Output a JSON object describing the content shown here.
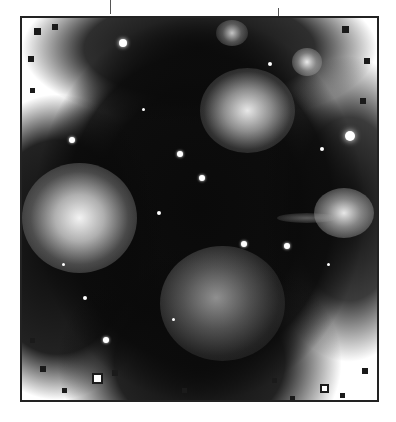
{
  "image": {
    "subject": "star cluster with reflection nebulae",
    "style": "grayscale",
    "frame_color": "#222222",
    "background_color": "#ffffff",
    "nebulae": [
      {
        "name": "left-nebula",
        "cx": 60,
        "cy": 200,
        "rx": 55,
        "ry": 50,
        "brightness": 0.95
      },
      {
        "name": "upper-center-nebula",
        "cx": 225,
        "cy": 90,
        "rx": 45,
        "ry": 38,
        "brightness": 0.85
      },
      {
        "name": "lower-center-nebula",
        "cx": 200,
        "cy": 285,
        "rx": 60,
        "ry": 55,
        "brightness": 0.6
      },
      {
        "name": "right-nebula",
        "cx": 322,
        "cy": 195,
        "rx": 28,
        "ry": 24,
        "brightness": 0.85
      },
      {
        "name": "upper-right-glow",
        "cx": 285,
        "cy": 45,
        "rx": 14,
        "ry": 13,
        "brightness": 0.8
      },
      {
        "name": "top-glow",
        "cx": 210,
        "cy": 15,
        "rx": 14,
        "ry": 12,
        "brightness": 0.7
      }
    ],
    "stars": [
      {
        "x": 101,
        "y": 25,
        "r": 4
      },
      {
        "x": 328,
        "y": 118,
        "r": 5
      },
      {
        "x": 50,
        "y": 122,
        "r": 3
      },
      {
        "x": 158,
        "y": 136,
        "r": 3
      },
      {
        "x": 180,
        "y": 160,
        "r": 3
      },
      {
        "x": 222,
        "y": 226,
        "r": 3
      },
      {
        "x": 265,
        "y": 228,
        "r": 3
      },
      {
        "x": 63,
        "y": 280,
        "r": 2
      },
      {
        "x": 84,
        "y": 322,
        "r": 3
      },
      {
        "x": 248,
        "y": 46,
        "r": 2
      },
      {
        "x": 300,
        "y": 131,
        "r": 2
      },
      {
        "x": 137,
        "y": 195,
        "r": 2
      }
    ]
  }
}
